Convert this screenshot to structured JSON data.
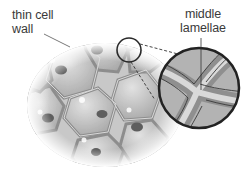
{
  "diagram": {
    "labels": {
      "thin_cell_wall": [
        "thin cell",
        "wall"
      ],
      "middle_lamellae": [
        "middle",
        "lamellae"
      ]
    },
    "colors": {
      "background": "#ffffff",
      "cell_fill": "#b9b9b9",
      "cell_wall": "#8e8e8e",
      "lamella": "#d6d6d6",
      "nucleus": "#5e5e5e",
      "outline": "#2a2a2a",
      "label_text": "#3a3a3a"
    },
    "cells_count": 9,
    "magnifier": {
      "cx": 199,
      "cy": 88,
      "r": 40
    },
    "small_circle": {
      "cx": 129,
      "cy": 50,
      "r": 12
    }
  }
}
